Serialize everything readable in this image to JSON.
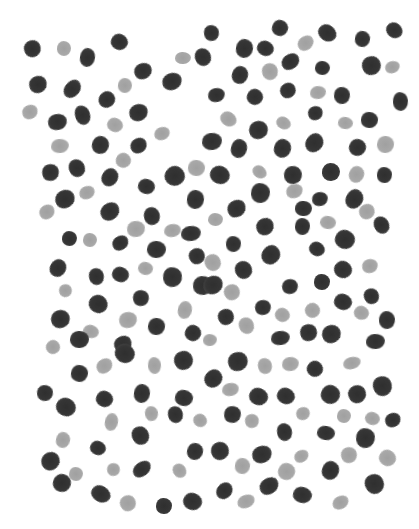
{
  "image": {
    "description": "Hand-painted dot pattern of dark and light gray blotches on white",
    "width": 419,
    "height": 529,
    "colors": {
      "background": "#ffffff",
      "dark": "#353535",
      "light": "#a8a8a8"
    }
  },
  "dots": [
    [
      33,
      49,
      "d"
    ],
    [
      64,
      48,
      "l"
    ],
    [
      88,
      58,
      "d"
    ],
    [
      120,
      42,
      "d"
    ],
    [
      183,
      58,
      "l"
    ],
    [
      203,
      57,
      "d"
    ],
    [
      38,
      84,
      "d"
    ],
    [
      73,
      89,
      "d"
    ],
    [
      107,
      99,
      "d"
    ],
    [
      125,
      85,
      "l"
    ],
    [
      143,
      71,
      "d"
    ],
    [
      172,
      81,
      "d"
    ],
    [
      30,
      112,
      "l"
    ],
    [
      57,
      122,
      "d"
    ],
    [
      83,
      115,
      "d"
    ],
    [
      139,
      112,
      "d"
    ],
    [
      115,
      125,
      "l"
    ],
    [
      162,
      133,
      "l"
    ],
    [
      139,
      145,
      "d"
    ],
    [
      101,
      145,
      "d"
    ],
    [
      60,
      146,
      "l"
    ],
    [
      124,
      160,
      "l"
    ],
    [
      51,
      172,
      "d"
    ],
    [
      77,
      168,
      "d"
    ],
    [
      110,
      177,
      "d"
    ],
    [
      175,
      176,
      "d"
    ],
    [
      196,
      168,
      "l"
    ],
    [
      212,
      33,
      "d"
    ],
    [
      280,
      28,
      "d"
    ],
    [
      327,
      33,
      "d"
    ],
    [
      363,
      39,
      "d"
    ],
    [
      395,
      30,
      "d"
    ],
    [
      245,
      49,
      "d"
    ],
    [
      266,
      48,
      "d"
    ],
    [
      306,
      43,
      "l"
    ],
    [
      240,
      75,
      "d"
    ],
    [
      270,
      72,
      "l"
    ],
    [
      291,
      62,
      "d"
    ],
    [
      323,
      68,
      "d"
    ],
    [
      372,
      66,
      "d"
    ],
    [
      393,
      67,
      "l"
    ],
    [
      217,
      95,
      "d"
    ],
    [
      255,
      97,
      "d"
    ],
    [
      288,
      90,
      "d"
    ],
    [
      318,
      92,
      "l"
    ],
    [
      342,
      95,
      "d"
    ],
    [
      401,
      101,
      "d"
    ],
    [
      228,
      119,
      "l"
    ],
    [
      258,
      130,
      "d"
    ],
    [
      283,
      123,
      "l"
    ],
    [
      316,
      113,
      "d"
    ],
    [
      345,
      123,
      "l"
    ],
    [
      370,
      120,
      "d"
    ],
    [
      212,
      142,
      "d"
    ],
    [
      239,
      149,
      "d"
    ],
    [
      283,
      149,
      "d"
    ],
    [
      315,
      143,
      "d"
    ],
    [
      358,
      147,
      "d"
    ],
    [
      385,
      145,
      "l"
    ],
    [
      220,
      175,
      "d"
    ],
    [
      260,
      172,
      "l"
    ],
    [
      293,
      175,
      "d"
    ],
    [
      331,
      172,
      "d"
    ],
    [
      357,
      175,
      "l"
    ],
    [
      385,
      175,
      "d"
    ],
    [
      65,
      199,
      "d"
    ],
    [
      87,
      193,
      "l"
    ],
    [
      47,
      212,
      "l"
    ],
    [
      110,
      212,
      "d"
    ],
    [
      146,
      187,
      "d"
    ],
    [
      152,
      216,
      "d"
    ],
    [
      136,
      229,
      "l"
    ],
    [
      173,
      231,
      "l"
    ],
    [
      196,
      200,
      "d"
    ],
    [
      70,
      238,
      "d"
    ],
    [
      90,
      240,
      "l"
    ],
    [
      120,
      243,
      "d"
    ],
    [
      156,
      249,
      "d"
    ],
    [
      191,
      233,
      "d"
    ],
    [
      197,
      256,
      "d"
    ],
    [
      58,
      268,
      "d"
    ],
    [
      97,
      277,
      "d"
    ],
    [
      120,
      275,
      "d"
    ],
    [
      146,
      269,
      "l"
    ],
    [
      173,
      277,
      "d"
    ],
    [
      203,
      285,
      "d"
    ],
    [
      66,
      291,
      "l"
    ],
    [
      98,
      304,
      "d"
    ],
    [
      141,
      298,
      "d"
    ],
    [
      185,
      310,
      "l"
    ],
    [
      60,
      319,
      "d"
    ],
    [
      91,
      331,
      "l"
    ],
    [
      128,
      320,
      "l"
    ],
    [
      156,
      327,
      "d"
    ],
    [
      193,
      333,
      "d"
    ],
    [
      79,
      340,
      "d"
    ],
    [
      123,
      344,
      "d"
    ],
    [
      53,
      347,
      "l"
    ],
    [
      260,
      193,
      "d"
    ],
    [
      237,
      208,
      "d"
    ],
    [
      295,
      191,
      "l"
    ],
    [
      320,
      199,
      "d"
    ],
    [
      354,
      199,
      "d"
    ],
    [
      367,
      212,
      "l"
    ],
    [
      216,
      219,
      "l"
    ],
    [
      303,
      209,
      "d"
    ],
    [
      328,
      223,
      "l"
    ],
    [
      265,
      226,
      "d"
    ],
    [
      303,
      226,
      "d"
    ],
    [
      382,
      225,
      "d"
    ],
    [
      234,
      244,
      "d"
    ],
    [
      271,
      255,
      "d"
    ],
    [
      317,
      249,
      "d"
    ],
    [
      345,
      240,
      "d"
    ],
    [
      213,
      263,
      "l"
    ],
    [
      243,
      270,
      "d"
    ],
    [
      370,
      266,
      "l"
    ],
    [
      213,
      285,
      "d"
    ],
    [
      232,
      292,
      "l"
    ],
    [
      290,
      286,
      "d"
    ],
    [
      322,
      282,
      "d"
    ],
    [
      343,
      270,
      "d"
    ],
    [
      372,
      296,
      "d"
    ],
    [
      263,
      307,
      "d"
    ],
    [
      226,
      317,
      "d"
    ],
    [
      283,
      315,
      "l"
    ],
    [
      313,
      311,
      "l"
    ],
    [
      343,
      302,
      "d"
    ],
    [
      362,
      313,
      "l"
    ],
    [
      387,
      320,
      "d"
    ],
    [
      247,
      326,
      "l"
    ],
    [
      309,
      332,
      "d"
    ],
    [
      331,
      334,
      "d"
    ],
    [
      375,
      341,
      "d"
    ],
    [
      280,
      338,
      "d"
    ],
    [
      210,
      340,
      "l"
    ],
    [
      104,
      366,
      "l"
    ],
    [
      80,
      373,
      "d"
    ],
    [
      155,
      365,
      "l"
    ],
    [
      183,
      360,
      "d"
    ],
    [
      125,
      353,
      "d"
    ],
    [
      45,
      393,
      "d"
    ],
    [
      66,
      407,
      "d"
    ],
    [
      105,
      399,
      "d"
    ],
    [
      142,
      393,
      "d"
    ],
    [
      184,
      398,
      "d"
    ],
    [
      152,
      413,
      "l"
    ],
    [
      176,
      415,
      "d"
    ],
    [
      112,
      422,
      "l"
    ],
    [
      200,
      421,
      "l"
    ],
    [
      63,
      440,
      "l"
    ],
    [
      140,
      436,
      "d"
    ],
    [
      98,
      448,
      "d"
    ],
    [
      51,
      461,
      "d"
    ],
    [
      114,
      470,
      "l"
    ],
    [
      142,
      469,
      "d"
    ],
    [
      195,
      452,
      "d"
    ],
    [
      76,
      474,
      "l"
    ],
    [
      180,
      470,
      "l"
    ],
    [
      62,
      483,
      "d"
    ],
    [
      101,
      494,
      "d"
    ],
    [
      128,
      503,
      "l"
    ],
    [
      164,
      506,
      "d"
    ],
    [
      192,
      502,
      "d"
    ],
    [
      238,
      362,
      "d"
    ],
    [
      265,
      366,
      "l"
    ],
    [
      290,
      364,
      "l"
    ],
    [
      315,
      369,
      "d"
    ],
    [
      352,
      363,
      "l"
    ],
    [
      213,
      378,
      "d"
    ],
    [
      230,
      390,
      "l"
    ],
    [
      258,
      397,
      "d"
    ],
    [
      286,
      396,
      "d"
    ],
    [
      330,
      395,
      "d"
    ],
    [
      357,
      394,
      "d"
    ],
    [
      382,
      386,
      "d"
    ],
    [
      233,
      414,
      "d"
    ],
    [
      252,
      421,
      "l"
    ],
    [
      303,
      413,
      "l"
    ],
    [
      344,
      416,
      "l"
    ],
    [
      372,
      418,
      "l"
    ],
    [
      393,
      420,
      "d"
    ],
    [
      285,
      432,
      "d"
    ],
    [
      326,
      433,
      "d"
    ],
    [
      366,
      438,
      "d"
    ],
    [
      220,
      451,
      "d"
    ],
    [
      262,
      455,
      "d"
    ],
    [
      302,
      456,
      "l"
    ],
    [
      349,
      455,
      "l"
    ],
    [
      387,
      458,
      "l"
    ],
    [
      242,
      466,
      "l"
    ],
    [
      286,
      472,
      "l"
    ],
    [
      330,
      471,
      "d"
    ],
    [
      374,
      484,
      "d"
    ],
    [
      225,
      491,
      "d"
    ],
    [
      269,
      486,
      "d"
    ],
    [
      302,
      495,
      "d"
    ],
    [
      246,
      501,
      "l"
    ],
    [
      340,
      502,
      "l"
    ]
  ]
}
